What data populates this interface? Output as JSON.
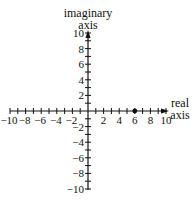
{
  "diagram": {
    "type": "complex-plane",
    "imaginary_axis_label_line1": "imaginary",
    "imaginary_axis_label_line2": "axis",
    "real_axis_label_line1": "real",
    "real_axis_label_line2": "axis",
    "real_tick_labels": [
      "−10",
      "−8",
      "−6",
      "−4",
      "−2",
      "2",
      "4",
      "6",
      "8",
      "10"
    ],
    "real_tick_values": [
      -10,
      -8,
      -6,
      -4,
      -2,
      2,
      4,
      6,
      8,
      10
    ],
    "imag_tick_labels": [
      "10",
      "8",
      "6",
      "4",
      "2",
      "−2",
      "−4",
      "−6",
      "−8",
      "−10"
    ],
    "imag_tick_values": [
      10,
      8,
      6,
      4,
      2,
      -2,
      -4,
      -6,
      -8,
      -10
    ],
    "range": {
      "real": [
        -10,
        10
      ],
      "imag": [
        -10,
        10
      ]
    },
    "minor_tick_step": 1,
    "labeled_tick_step": 2,
    "plotted_points": [
      {
        "re": 6,
        "im": 0,
        "label": ""
      }
    ],
    "colors": {
      "ink": "#111111",
      "background": "#ffffff"
    }
  }
}
